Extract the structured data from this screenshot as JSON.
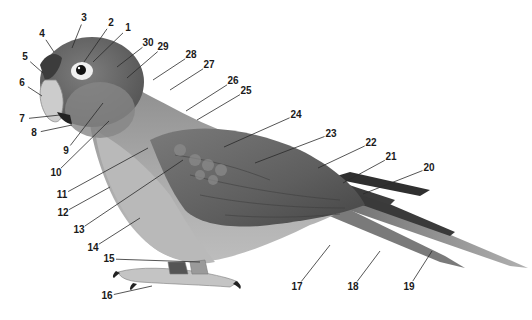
{
  "figure": {
    "colors": {
      "background": "#ffffff",
      "label_text": "#1a1a1a",
      "leader_line": "#2a2a2a",
      "head_dark": "#5a5a5a",
      "head_mid": "#7a7a7a",
      "breast_light": "#b4b4b4",
      "wing_dark": "#4a4a4a",
      "wing_mid": "#6e6e6e",
      "tail_light": "#9a9a9a",
      "beak": "#cfcfcf",
      "eye_ring": "#f2f2f2",
      "feet": "#c8c8c8"
    },
    "labels": [
      {
        "n": "1",
        "x": 128,
        "y": 28,
        "tx": 93,
        "ty": 62
      },
      {
        "n": "2",
        "x": 111,
        "y": 23,
        "tx": 84,
        "ty": 62
      },
      {
        "n": "3",
        "x": 84,
        "y": 18,
        "tx": 72,
        "ty": 48
      },
      {
        "n": "4",
        "x": 42,
        "y": 34,
        "tx": 54,
        "ty": 52
      },
      {
        "n": "5",
        "x": 25,
        "y": 57,
        "tx": 43,
        "ty": 73
      },
      {
        "n": "6",
        "x": 22,
        "y": 83,
        "tx": 42,
        "ty": 96
      },
      {
        "n": "7",
        "x": 22,
        "y": 119,
        "tx": 60,
        "ty": 115
      },
      {
        "n": "8",
        "x": 34,
        "y": 133,
        "tx": 72,
        "ty": 125
      },
      {
        "n": "9",
        "x": 66,
        "y": 151,
        "tx": 103,
        "ty": 103
      },
      {
        "n": "10",
        "x": 56,
        "y": 173,
        "tx": 109,
        "ty": 121
      },
      {
        "n": "11",
        "x": 62,
        "y": 195,
        "tx": 148,
        "ty": 148
      },
      {
        "n": "12",
        "x": 63,
        "y": 213,
        "tx": 110,
        "ty": 187
      },
      {
        "n": "13",
        "x": 79,
        "y": 230,
        "tx": 183,
        "ty": 160
      },
      {
        "n": "14",
        "x": 93,
        "y": 248,
        "tx": 140,
        "ty": 218
      },
      {
        "n": "15",
        "x": 109,
        "y": 259,
        "tx": 200,
        "ty": 262
      },
      {
        "n": "16",
        "x": 107,
        "y": 296,
        "tx": 152,
        "ty": 286
      },
      {
        "n": "17",
        "x": 297,
        "y": 287,
        "tx": 330,
        "ty": 245
      },
      {
        "n": "18",
        "x": 353,
        "y": 287,
        "tx": 380,
        "ty": 251
      },
      {
        "n": "19",
        "x": 409,
        "y": 287,
        "tx": 432,
        "ty": 251
      },
      {
        "n": "20",
        "x": 429,
        "y": 168,
        "tx": 363,
        "ty": 194
      },
      {
        "n": "21",
        "x": 391,
        "y": 157,
        "tx": 343,
        "ty": 183
      },
      {
        "n": "22",
        "x": 371,
        "y": 143,
        "tx": 318,
        "ty": 168
      },
      {
        "n": "23",
        "x": 331,
        "y": 134,
        "tx": 255,
        "ty": 163
      },
      {
        "n": "24",
        "x": 296,
        "y": 115,
        "tx": 224,
        "ty": 147
      },
      {
        "n": "25",
        "x": 246,
        "y": 91,
        "tx": 197,
        "ty": 120
      },
      {
        "n": "26",
        "x": 233,
        "y": 81,
        "tx": 186,
        "ty": 111
      },
      {
        "n": "27",
        "x": 209,
        "y": 65,
        "tx": 170,
        "ty": 90
      },
      {
        "n": "28",
        "x": 191,
        "y": 55,
        "tx": 153,
        "ty": 80
      },
      {
        "n": "29",
        "x": 163,
        "y": 47,
        "tx": 127,
        "ty": 78
      },
      {
        "n": "30",
        "x": 148,
        "y": 43,
        "tx": 117,
        "ty": 67
      }
    ]
  }
}
